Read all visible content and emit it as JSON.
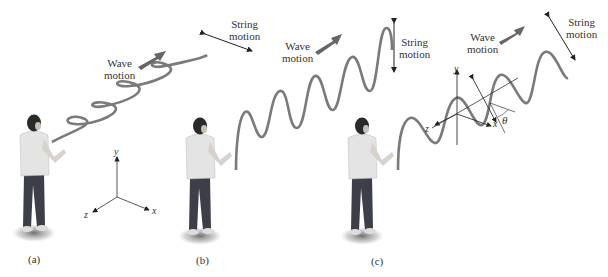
{
  "panels": [
    {
      "id": "a",
      "label": "(a)",
      "wave_motion_label": [
        "Wave",
        "motion"
      ],
      "string_motion_label": [
        "String",
        "motion"
      ],
      "axes": {
        "x": "x",
        "y": "y",
        "z": "z"
      }
    },
    {
      "id": "b",
      "label": "(b)",
      "wave_motion_label": [
        "Wave",
        "motion"
      ],
      "string_motion_label": [
        "String",
        "motion"
      ]
    },
    {
      "id": "c",
      "label": "(c)",
      "wave_motion_label": [
        "Wave",
        "motion"
      ],
      "string_motion_label": [
        "String",
        "motion"
      ],
      "axes": {
        "x": "x",
        "y": "y",
        "z": "z"
      },
      "angle_label": "θ"
    }
  ],
  "colors": {
    "string": "#7a7a7a",
    "arrow": "#666666",
    "shirt": "#e4e4e4",
    "pants": "#3c3f48",
    "hair": "#2a2a2a",
    "skin": "#c9c0b8",
    "text": "#333333"
  }
}
